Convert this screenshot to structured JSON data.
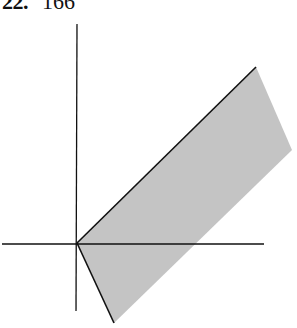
{
  "header": {
    "problem_number": "22.",
    "answer": "166"
  },
  "figure": {
    "colors": {
      "axis": "#111111",
      "region_fill": "#c4c4c4",
      "boundary": "#111111"
    },
    "origin": [
      77,
      243
    ],
    "horizontal_axis": {
      "from": [
        2,
        244
      ],
      "to": [
        264,
        244
      ]
    },
    "vertical_axis": {
      "from": [
        77,
        24
      ],
      "to": [
        76,
        311
      ]
    },
    "region_polygon": [
      [
        77,
        243
      ],
      [
        256,
        67
      ],
      [
        292,
        150
      ],
      [
        114,
        323
      ]
    ],
    "boundary_rays": [
      {
        "from": [
          77,
          243
        ],
        "to": [
          256,
          67
        ]
      },
      {
        "from": [
          77,
          243
        ],
        "to": [
          114,
          323
        ]
      }
    ]
  }
}
